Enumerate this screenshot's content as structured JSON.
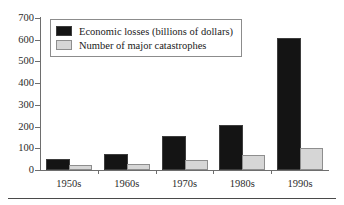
{
  "chart_data": {
    "type": "bar",
    "title": "",
    "subtitle": "",
    "xlabel": "",
    "ylabel": "",
    "categories": [
      "1950s",
      "1960s",
      "1970s",
      "1980s",
      "1990s"
    ],
    "series": [
      {
        "name": "Economic losses (billions of dollars)",
        "color": "#141414",
        "values": [
          50,
          75,
          155,
          208,
          610
        ]
      },
      {
        "name": "Number of major catastrophes",
        "color": "#d6d6d6",
        "values": [
          25,
          30,
          48,
          70,
          100
        ]
      }
    ],
    "ylim": [
      0,
      700
    ],
    "yticks": [
      0,
      100,
      200,
      300,
      400,
      500,
      600,
      700
    ],
    "ytick_labels": [
      "0",
      "100",
      "200",
      "300",
      "400",
      "500",
      "600",
      "700"
    ],
    "grid": false,
    "legend_position": "top-left"
  },
  "legend": {
    "entries": [
      {
        "label": "Economic losses (billions of dollars)",
        "swatch": "black-square-swatch"
      },
      {
        "label": "Number of major catastrophes",
        "swatch": "gray-square-swatch"
      }
    ]
  },
  "colors": {
    "losses_fill": "#141414",
    "catastrophes_fill": "#d6d6d6",
    "axis": "#6e6e6e",
    "text": "#1a1a1a",
    "rule": "#4a4a4a"
  }
}
